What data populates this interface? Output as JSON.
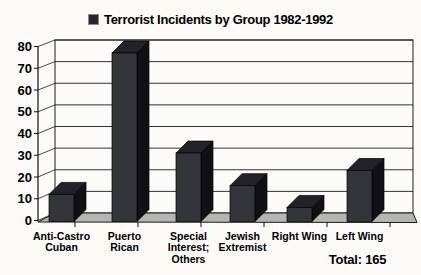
{
  "window": {
    "background": "#fbfaf7"
  },
  "header": {
    "legend_marker": "dark-square-icon"
  },
  "chart_data": {
    "type": "bar",
    "style": "3d-column",
    "title": "Terrorist Incidents by Group 1982-1992",
    "categories": [
      "Anti-Castro Cuban",
      "Puerto Rican",
      "Special Interest; Others",
      "Jewish Extremist",
      "Right Wing",
      "Left Wing"
    ],
    "category_label_lines": [
      [
        "Anti-Castro",
        "Cuban"
      ],
      [
        "Puerto",
        "Rican"
      ],
      [
        "Special",
        "Interest;",
        "Others"
      ],
      [
        "Jewish",
        "Extremist"
      ],
      [
        "Right Wing"
      ],
      [
        "Left Wing"
      ]
    ],
    "values": [
      12,
      77,
      31,
      16,
      6,
      23
    ],
    "total": 165,
    "total_label": "Total: 165",
    "xlabel": "",
    "ylabel": "",
    "ylim": [
      0,
      80
    ],
    "yticks": [
      0,
      10,
      20,
      30,
      40,
      50,
      60,
      70,
      80
    ],
    "grid": true,
    "legend_position": "inline-with-title",
    "colors": {
      "background": "#fbfaf7",
      "wall": "#fcfbf8",
      "floor": "#b5b5b3",
      "grid_line": "#1c1c1c",
      "axis_line": "#111111",
      "bar_front": "#34343b",
      "bar_side": "#111115",
      "bar_top": "#222228",
      "text": "#000000"
    }
  }
}
